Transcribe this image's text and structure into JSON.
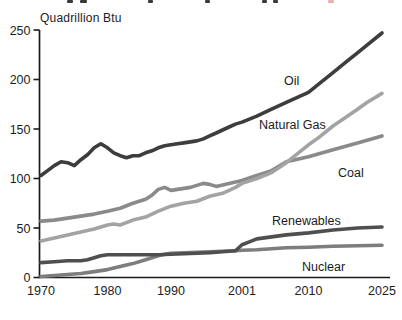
{
  "colors": {
    "background": "#ffffff",
    "axis": "#1a1a1a",
    "text": "#1c1c1c",
    "fragment_dark": "#3a3a3a",
    "fragment_red": "#e6b3b3"
  },
  "chart_data": {
    "type": "line",
    "unit_label": "Quadrillion Btu",
    "x_tick_labels": [
      "1970",
      "1980",
      "1990",
      "2001",
      "2010",
      "2025"
    ],
    "y_ticks": [
      0,
      50,
      100,
      150,
      200,
      250
    ],
    "ylim": [
      0,
      250
    ],
    "grid": false,
    "legend_position": "inline-labels",
    "series": [
      {
        "name": "Coal",
        "color": "#8a8a8a",
        "label_x": 338,
        "label_y": 177,
        "points": [
          [
            1970,
            57
          ],
          [
            1972,
            58
          ],
          [
            1974,
            60
          ],
          [
            1976,
            62
          ],
          [
            1978,
            64
          ],
          [
            1980,
            67
          ],
          [
            1982,
            70
          ],
          [
            1984,
            75
          ],
          [
            1986,
            79
          ],
          [
            1987,
            83
          ],
          [
            1988,
            89
          ],
          [
            1989,
            91
          ],
          [
            1990,
            88
          ],
          [
            1991,
            89
          ],
          [
            1993,
            91
          ],
          [
            1995,
            95
          ],
          [
            1996,
            94
          ],
          [
            1997,
            92
          ],
          [
            1999,
            95
          ],
          [
            2001,
            98
          ],
          [
            2003,
            103
          ],
          [
            2005,
            108
          ],
          [
            2007,
            117
          ],
          [
            2010,
            122
          ],
          [
            2015,
            129
          ],
          [
            2020,
            136
          ],
          [
            2025,
            143
          ]
        ]
      },
      {
        "name": "Natural Gas",
        "color": "#a3a3a3",
        "label_x": 259,
        "label_y": 129,
        "points": [
          [
            1970,
            37
          ],
          [
            1972,
            40
          ],
          [
            1974,
            43
          ],
          [
            1976,
            46
          ],
          [
            1978,
            49
          ],
          [
            1980,
            53
          ],
          [
            1981,
            54
          ],
          [
            1982,
            53
          ],
          [
            1984,
            58
          ],
          [
            1986,
            61
          ],
          [
            1988,
            67
          ],
          [
            1990,
            72
          ],
          [
            1992,
            75
          ],
          [
            1994,
            77
          ],
          [
            1996,
            82
          ],
          [
            1998,
            85
          ],
          [
            2000,
            91
          ],
          [
            2001,
            95
          ],
          [
            2003,
            100
          ],
          [
            2005,
            106
          ],
          [
            2007,
            116
          ],
          [
            2010,
            134
          ],
          [
            2012,
            141
          ],
          [
            2015,
            153
          ],
          [
            2018,
            163
          ],
          [
            2020,
            170
          ],
          [
            2022,
            177
          ],
          [
            2025,
            186
          ]
        ]
      },
      {
        "name": "Nuclear",
        "color": "#7d7d7d",
        "label_x": 302,
        "label_y": 271,
        "points": [
          [
            1970,
            1
          ],
          [
            1972,
            2
          ],
          [
            1974,
            3
          ],
          [
            1976,
            4
          ],
          [
            1978,
            6
          ],
          [
            1980,
            8
          ],
          [
            1982,
            11
          ],
          [
            1984,
            14
          ],
          [
            1986,
            18
          ],
          [
            1988,
            22
          ],
          [
            1989,
            23.5
          ],
          [
            1990,
            24.5
          ],
          [
            1992,
            25
          ],
          [
            1994,
            25.5
          ],
          [
            1996,
            26
          ],
          [
            1998,
            26.5
          ],
          [
            2000,
            27
          ],
          [
            2001,
            27.5
          ],
          [
            2003,
            28
          ],
          [
            2005,
            29
          ],
          [
            2007,
            30
          ],
          [
            2010,
            30.5
          ],
          [
            2015,
            31.5
          ],
          [
            2020,
            32
          ],
          [
            2025,
            32.5
          ]
        ]
      },
      {
        "name": "Renewables",
        "color": "#4f4f4f",
        "label_x": 272,
        "label_y": 225,
        "points": [
          [
            1970,
            15
          ],
          [
            1972,
            16
          ],
          [
            1974,
            17
          ],
          [
            1976,
            17
          ],
          [
            1977,
            18
          ],
          [
            1978,
            20
          ],
          [
            1979,
            22
          ],
          [
            1980,
            23
          ],
          [
            1982,
            23
          ],
          [
            1984,
            23
          ],
          [
            1986,
            23
          ],
          [
            1988,
            23
          ],
          [
            1990,
            23.5
          ],
          [
            1992,
            24
          ],
          [
            1994,
            24.5
          ],
          [
            1996,
            25
          ],
          [
            1998,
            26
          ],
          [
            2000,
            27
          ],
          [
            2001,
            33
          ],
          [
            2002,
            36
          ],
          [
            2003,
            39
          ],
          [
            2005,
            41
          ],
          [
            2007,
            43
          ],
          [
            2010,
            45
          ],
          [
            2015,
            48
          ],
          [
            2020,
            50
          ],
          [
            2025,
            51
          ]
        ]
      },
      {
        "name": "Oil",
        "color": "#3d3d3d",
        "label_x": 284,
        "label_y": 85,
        "points": [
          [
            1970,
            103
          ],
          [
            1971,
            108
          ],
          [
            1972,
            113
          ],
          [
            1973,
            117
          ],
          [
            1974,
            116
          ],
          [
            1975,
            113
          ],
          [
            1976,
            119
          ],
          [
            1977,
            124
          ],
          [
            1978,
            131
          ],
          [
            1979,
            135
          ],
          [
            1980,
            131
          ],
          [
            1981,
            126
          ],
          [
            1982,
            123
          ],
          [
            1983,
            121
          ],
          [
            1984,
            123
          ],
          [
            1985,
            123
          ],
          [
            1986,
            126
          ],
          [
            1987,
            128
          ],
          [
            1988,
            131
          ],
          [
            1989,
            133
          ],
          [
            1990,
            134
          ],
          [
            1991,
            135
          ],
          [
            1992,
            136
          ],
          [
            1993,
            137
          ],
          [
            1994,
            138
          ],
          [
            1995,
            140
          ],
          [
            1996,
            143
          ],
          [
            1997,
            146
          ],
          [
            1998,
            149
          ],
          [
            1999,
            152
          ],
          [
            2000,
            155
          ],
          [
            2001,
            157
          ],
          [
            2003,
            163
          ],
          [
            2005,
            170
          ],
          [
            2007,
            177
          ],
          [
            2010,
            187
          ],
          [
            2012,
            195
          ],
          [
            2015,
            207
          ],
          [
            2018,
            219
          ],
          [
            2020,
            227
          ],
          [
            2022,
            235
          ],
          [
            2025,
            247
          ]
        ]
      }
    ]
  },
  "cropped_title_fragments": [
    {
      "x": 67,
      "w": 6,
      "red": false
    },
    {
      "x": 80,
      "w": 7,
      "red": false
    },
    {
      "x": 148,
      "w": 5,
      "red": false
    },
    {
      "x": 205,
      "w": 5,
      "red": false
    },
    {
      "x": 262,
      "w": 5,
      "red": false
    },
    {
      "x": 273,
      "w": 5,
      "red": false
    },
    {
      "x": 328,
      "w": 6,
      "red": true
    }
  ]
}
